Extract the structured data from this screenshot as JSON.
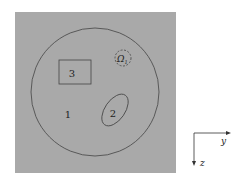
{
  "diagram": {
    "background_color": "#a9a9a9",
    "line_color": "#444444",
    "regions": [
      {
        "id": "region-1",
        "label": "1",
        "shape": "circle"
      },
      {
        "id": "region-2",
        "label": "2",
        "shape": "ellipse"
      },
      {
        "id": "region-3",
        "label": "3",
        "shape": "rectangle"
      },
      {
        "id": "omega-1",
        "label": "Ω",
        "subscript": "1",
        "shape": "dashed-circle"
      }
    ],
    "axes": {
      "horizontal": "y",
      "vertical": "z"
    }
  }
}
